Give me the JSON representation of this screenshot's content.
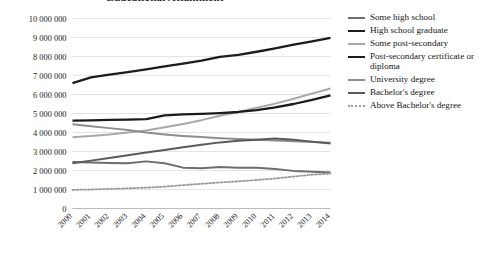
{
  "chart_data": {
    "type": "line",
    "title": "Educational Attainment",
    "xlabel": "",
    "ylabel": "",
    "x": [
      2000,
      2001,
      2002,
      2003,
      2004,
      2005,
      2006,
      2007,
      2008,
      2009,
      2010,
      2011,
      2012,
      2013,
      2014
    ],
    "categories": [
      "2000",
      "2001",
      "2002",
      "2003",
      "2004",
      "2005",
      "2006",
      "2007",
      "2008",
      "2009",
      "2010",
      "2011",
      "2012",
      "2013",
      "2014"
    ],
    "ylim": [
      0,
      10000000
    ],
    "ytick_values": [
      0,
      1000000,
      2000000,
      3000000,
      4000000,
      5000000,
      6000000,
      7000000,
      8000000,
      9000000,
      10000000
    ],
    "ytick_labels": [
      "0",
      "1 000 000",
      "2 000 000",
      "3 000 000",
      "4 000 000",
      "5 000 000",
      "6 000 000",
      "7 000 000",
      "8 000 000",
      "9 000 000",
      "10 000 000"
    ],
    "grid": true,
    "legend_position": "right",
    "series": [
      {
        "name": "Some high school",
        "color": "#6e6e6e",
        "style": "solid",
        "width": 2.0,
        "values": [
          2450000,
          2420000,
          2400000,
          2380000,
          2480000,
          2380000,
          2150000,
          2120000,
          2180000,
          2150000,
          2140000,
          2080000,
          1980000,
          1940000,
          1900000
        ]
      },
      {
        "name": "High school graduate",
        "color": "#1c1c1c",
        "style": "solid",
        "width": 2.3,
        "values": [
          6600000,
          6900000,
          7050000,
          7180000,
          7320000,
          7480000,
          7620000,
          7780000,
          7980000,
          8080000,
          8250000,
          8430000,
          8620000,
          8800000,
          8980000
        ]
      },
      {
        "name": "Some post-secondary",
        "color": "#a8a8a8",
        "style": "solid",
        "width": 2.0,
        "values": [
          3750000,
          3820000,
          3900000,
          4000000,
          4100000,
          4280000,
          4450000,
          4650000,
          4880000,
          5080000,
          5300000,
          5520000,
          5780000,
          6050000,
          6320000
        ]
      },
      {
        "name": "Post-secondary certificate or diploma",
        "color": "#1c1c1c",
        "style": "solid",
        "width": 2.3,
        "values": [
          4620000,
          4640000,
          4660000,
          4680000,
          4700000,
          4900000,
          4950000,
          4980000,
          5020000,
          5080000,
          5180000,
          5320000,
          5500000,
          5720000,
          5950000
        ]
      },
      {
        "name": "University degree",
        "color": "#8e8e8e",
        "style": "solid",
        "width": 2.0,
        "values": [
          4430000,
          4330000,
          4230000,
          4130000,
          4000000,
          3900000,
          3820000,
          3760000,
          3700000,
          3660000,
          3620000,
          3580000,
          3540000,
          3500000,
          3460000
        ]
      },
      {
        "name": "Bachelor's degree",
        "color": "#5a5a5a",
        "style": "solid",
        "width": 2.0,
        "values": [
          2380000,
          2520000,
          2660000,
          2800000,
          2950000,
          3080000,
          3220000,
          3350000,
          3480000,
          3560000,
          3620000,
          3680000,
          3620000,
          3520000,
          3420000
        ]
      },
      {
        "name": "Above Bachelor's degree",
        "color": "#9a9a9a",
        "style": "dotted",
        "width": 1.8,
        "values": [
          980000,
          1000000,
          1030000,
          1060000,
          1100000,
          1150000,
          1230000,
          1300000,
          1370000,
          1430000,
          1500000,
          1580000,
          1680000,
          1780000,
          1840000
        ]
      }
    ]
  },
  "legend": {
    "items": [
      {
        "label": "Some high school"
      },
      {
        "label": "High school graduate"
      },
      {
        "label": "Some post-secondary"
      },
      {
        "label": "Post-secondary certificate or diploma"
      },
      {
        "label": "University degree"
      },
      {
        "label": "Bachelor's degree"
      },
      {
        "label": "Above Bachelor's degree"
      }
    ]
  }
}
